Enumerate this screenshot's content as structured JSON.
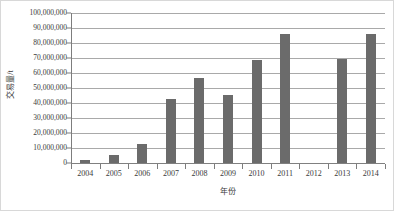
{
  "chart_data": {
    "type": "bar",
    "title": "",
    "subtitle": "",
    "xlabel": "年份",
    "ylabel": "交易量/t",
    "categories": [
      "2004",
      "2005",
      "2006",
      "2007",
      "2008",
      "2009",
      "2010",
      "2011",
      "2012",
      "2013",
      "2014"
    ],
    "values": [
      1800000,
      5200000,
      13000000,
      42500000,
      56500000,
      45500000,
      69000000,
      86300000,
      0,
      69300000,
      86200000
    ],
    "series": [
      {
        "name": "交易量",
        "values": [
          1800000,
          5200000,
          13000000,
          42500000,
          56500000,
          45500000,
          69000000,
          86300000,
          0,
          69300000,
          86200000
        ]
      }
    ],
    "ylim": [
      0,
      100000000
    ],
    "ytick_values": [
      0,
      10000000,
      20000000,
      30000000,
      40000000,
      50000000,
      60000000,
      70000000,
      80000000,
      90000000,
      100000000
    ],
    "ytick_labels": [
      "0",
      "10,000,000",
      "20,000,000",
      "30,000,000",
      "40,000,000",
      "50,000,000",
      "60,000,000",
      "70,000,000",
      "80,000,000",
      "90,000,000",
      "100,000,000"
    ],
    "grid": true,
    "grid_axis": "y",
    "legend": false,
    "legend_position": "none",
    "bar_color": "#6b6b6b",
    "gridline_color": "#a9a9a9",
    "axis_color": "#7d7d7d",
    "border_color": "#d8d8d8",
    "background_color": "#ffffff",
    "text_color": "#3a3a3a",
    "annotations": []
  }
}
